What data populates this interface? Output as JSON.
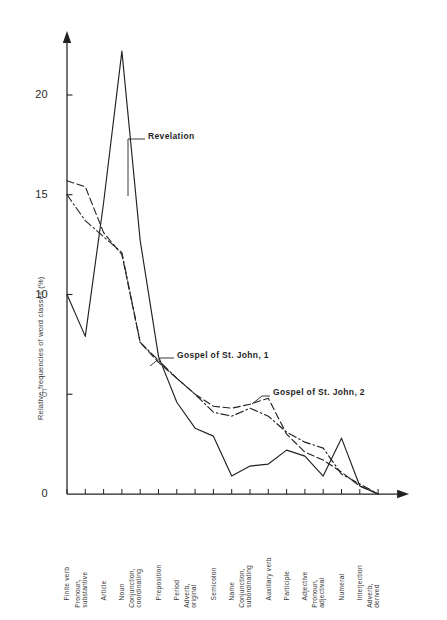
{
  "figure": {
    "background": "#ffffff",
    "ink": "#222222"
  },
  "chart_data": {
    "type": "line",
    "title": "",
    "xlabel": "",
    "ylabel": "Relative frequencies of word classes (%)",
    "ylim": [
      0,
      23
    ],
    "yticks": [
      0,
      5,
      10,
      15,
      20
    ],
    "ytick_labels": [
      "0",
      "5",
      "10",
      "15",
      "20"
    ],
    "grid": false,
    "legend_position": "inline-annotations",
    "categories": [
      "Finite verb",
      "Pronoun, substantive",
      "Article",
      "Noun",
      "Conjunction, coordinating",
      "Preposition",
      "Period",
      "Adverb, original",
      "Semicolon",
      "Name",
      "Conjunction, subordinating",
      "Auxiliary verb",
      "Participle",
      "Adjective",
      "Pronoun, adjectival",
      "Numeral",
      "Interjection",
      "Adverb, derived"
    ],
    "series": [
      {
        "name": "Revelation",
        "style": "solid",
        "color": "#222222",
        "values": [
          10.0,
          7.9,
          14.6,
          22.2,
          12.7,
          6.9,
          4.6,
          3.3,
          2.9,
          0.9,
          1.4,
          1.5,
          2.2,
          1.9,
          0.9,
          2.8,
          0.4,
          0.0
        ]
      },
      {
        "name": "Gospel of St. John, 1",
        "style": "dashed",
        "color": "#222222",
        "values": [
          15.7,
          15.4,
          13.1,
          12.0,
          7.6,
          6.6,
          5.8,
          5.0,
          4.4,
          4.3,
          4.5,
          4.8,
          3.0,
          2.1,
          1.7,
          1.1,
          0.4,
          0.0
        ]
      },
      {
        "name": "Gospel of St. John, 2",
        "style": "dashdot",
        "color": "#222222",
        "values": [
          15.0,
          13.7,
          12.9,
          12.1,
          7.6,
          6.7,
          5.8,
          5.0,
          4.1,
          3.9,
          4.3,
          3.9,
          3.1,
          2.6,
          2.3,
          1.0,
          0.5,
          0.0
        ]
      }
    ],
    "annotations": [
      {
        "text": "Revelation",
        "series": "Revelation",
        "anchor_category": "Noun"
      },
      {
        "text": "Gospel of St. John, 1",
        "series": "Gospel of St. John, 1",
        "anchor_category": "Preposition"
      },
      {
        "text": "Gospel of St. John, 2",
        "series": "Gospel of St. John, 2",
        "anchor_category": "Semicolon"
      }
    ]
  }
}
